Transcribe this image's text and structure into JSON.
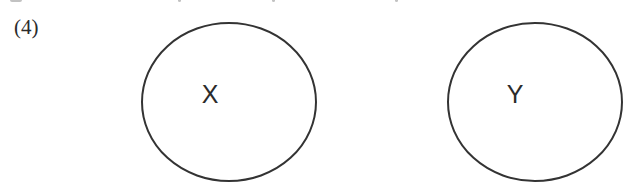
{
  "item": {
    "number_label": "(4)"
  },
  "diagram": {
    "type": "two disjoint sets (Venn)",
    "stroke_color": "#333333",
    "sets": [
      {
        "label": "X",
        "cx": 229,
        "cy": 102,
        "rx": 87,
        "ry": 79,
        "label_x": 210,
        "label_y": 103
      },
      {
        "label": "Y",
        "cx": 535,
        "cy": 102,
        "rx": 87,
        "ry": 79,
        "label_x": 515,
        "label_y": 103
      }
    ]
  }
}
